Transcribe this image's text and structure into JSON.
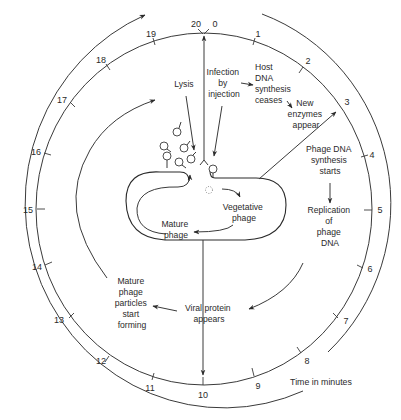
{
  "diagram": {
    "time_axis_label": "Time in minutes",
    "ticks": [
      "0",
      "1",
      "2",
      "3",
      "4",
      "5",
      "6",
      "7",
      "8",
      "9",
      "10",
      "11",
      "12",
      "13",
      "14",
      "15",
      "16",
      "17",
      "18",
      "19",
      "20"
    ],
    "labels": {
      "lysis": "Lysis",
      "infection": [
        "Infection",
        "by",
        "injection"
      ],
      "host_dna": [
        "Host",
        "DNA",
        "synthesis",
        "ceases"
      ],
      "new_enzymes": [
        "New",
        "enzymes",
        "appear"
      ],
      "phage_dna_synthesis": [
        "Phage DNA",
        "synthesis",
        "starts"
      ],
      "replication": [
        "Replication",
        "of",
        "phage",
        "DNA"
      ],
      "vegetative": [
        "Vegetative",
        "phage"
      ],
      "mature_phage": [
        "Mature",
        "phage"
      ],
      "viral_protein": [
        "Viral protein",
        "appears"
      ],
      "mature_particles": [
        "Mature",
        "phage",
        "particles",
        "start",
        "forming"
      ]
    },
    "colors": {
      "line": "#3a3a3a",
      "text": "#2a2a2a",
      "background": "#ffffff"
    }
  }
}
